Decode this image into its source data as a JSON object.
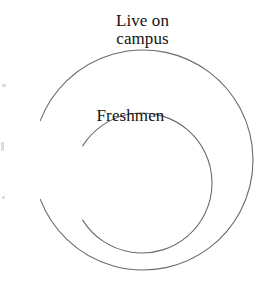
{
  "figure": {
    "kind": "euler-diagram",
    "width": 267,
    "height": 283,
    "background_color": "#ffffff"
  },
  "style": {
    "stroke_color": "#6a6a6a",
    "stroke_width": 1.1,
    "text_color": "#141414",
    "font_size_px": 17
  },
  "sets": {
    "outer": {
      "label": "Live on\ncampus",
      "label_line_1": "Live on",
      "label_line_2": "campus",
      "center_x": 143,
      "center_y": 160,
      "radius": 110,
      "gap_start_deg": 249,
      "gap_end_deg": 291
    },
    "inner": {
      "label": "Freshmen",
      "center_x": 142,
      "center_y": 183,
      "radius": 70,
      "gap_start_deg": 238,
      "gap_end_deg": 302
    }
  }
}
